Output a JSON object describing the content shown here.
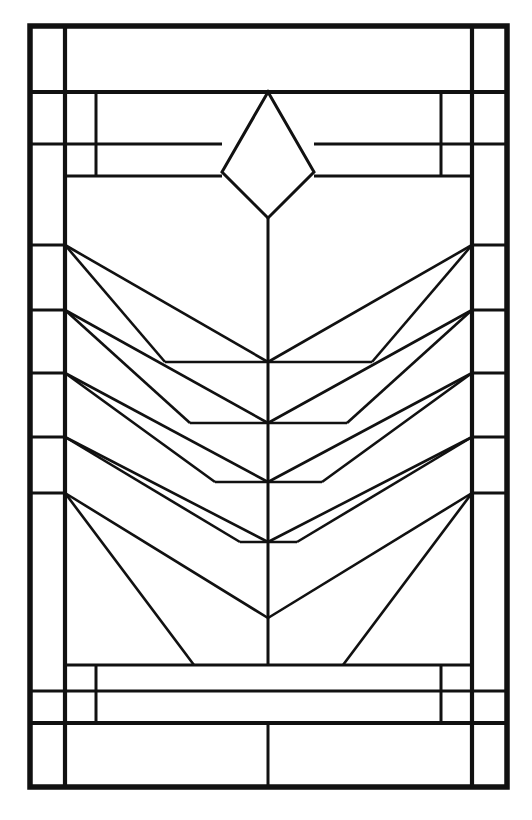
{
  "document": {
    "title": "Prairie-Style Stained Glass Window Pattern",
    "description": "Line-art leaded glass window design: rectangular border with corner blocks, a central diamond at top, a vertical center stem, and five nested chevron bands radiating from the side rails to the center.",
    "background_color": "#ffffff",
    "line_color": "#111111",
    "orientation": "portrait"
  },
  "canvas": {
    "width": 532,
    "height": 820
  },
  "geometry": {
    "frame": {
      "left": 30,
      "right": 507,
      "top": 26,
      "bottom": 787,
      "outer_stroke": 5.5
    },
    "rails": {
      "left_outer": 65,
      "left_inner": 96,
      "right_inner": 441,
      "right_outer": 472,
      "center": 268,
      "rail_stroke": 4.2,
      "inner_stroke": 3.0
    },
    "top_bands": {
      "band_1_y": 92,
      "band_2_y": 144,
      "band_3_y": 176
    },
    "bottom_bands": {
      "band_1_y": 665,
      "band_2_y": 691,
      "band_3_y": 723
    },
    "diamond": {
      "apex_x": 268,
      "apex_y": 92,
      "left_x": 222,
      "right_x": 314,
      "waist_y": 172,
      "bottom_y": 218
    },
    "stem": {
      "x": 268,
      "top_y": 218,
      "bottom_y": 665
    },
    "left_anchors_y": [
      245,
      310,
      373,
      437,
      493
    ],
    "right_anchors_y": [
      245,
      310,
      373,
      437,
      493
    ],
    "chevron_apex_y": [
      362,
      423,
      482,
      542,
      618
    ],
    "chevron_shoulder_x_left": [
      165,
      190,
      215,
      240,
      268
    ],
    "chevron_shoulder_x_right": [
      372,
      347,
      322,
      297,
      268
    ],
    "chevron_stroke": 2.6,
    "bottom_splay": {
      "left_start_x": 65,
      "left_start_y": 493,
      "left_end_x": 194,
      "left_end_y": 665,
      "right_start_x": 472,
      "right_start_y": 493,
      "right_end_x": 343,
      "right_end_y": 665
    }
  },
  "panes": {
    "top_left_corner_label": "corner-block-top-left",
    "top_right_corner_label": "corner-block-top-right",
    "bottom_left_corner_label": "corner-block-bottom-left",
    "bottom_right_corner_label": "corner-block-bottom-right",
    "top_header_label": "top-header-pane",
    "bottom_footer_label": "bottom-footer-pane",
    "diamond_label": "central-diamond-pane",
    "left_margin_blocks": 5,
    "right_margin_blocks": 5,
    "chevron_bands": 5
  },
  "legend": {
    "visible": false,
    "items": []
  }
}
